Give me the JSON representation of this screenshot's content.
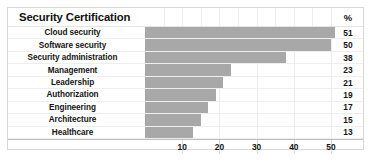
{
  "chart_data": {
    "type": "bar",
    "orientation": "horizontal",
    "title": "Security Certification",
    "value_header": "%",
    "xlabel": "",
    "ylabel": "",
    "xlim": [
      0,
      53
    ],
    "xticks": [
      10,
      20,
      30,
      40,
      50
    ],
    "grid": true,
    "legend": "none",
    "bar_color": "#a8a8a8",
    "categories": [
      "Cloud security",
      "Software security",
      "Security administration",
      "Management",
      "Leadership",
      "Authorization",
      "Engineering",
      "Architecture",
      "Healthcare"
    ],
    "values": [
      51,
      50,
      38,
      23,
      21,
      19,
      17,
      15,
      13
    ]
  },
  "table": {
    "rows": [
      {
        "label": "Cloud security",
        "value": "51"
      },
      {
        "label": "Software security",
        "value": "50"
      },
      {
        "label": "Security administration",
        "value": "38"
      },
      {
        "label": "Management",
        "value": "23"
      },
      {
        "label": "Leadership",
        "value": "21"
      },
      {
        "label": "Authorization",
        "value": "19"
      },
      {
        "label": "Engineering",
        "value": "17"
      },
      {
        "label": "Architecture",
        "value": "15"
      },
      {
        "label": "Healthcare",
        "value": "13"
      }
    ]
  },
  "axis": {
    "ticks": [
      "10",
      "20",
      "30",
      "40",
      "50"
    ]
  }
}
